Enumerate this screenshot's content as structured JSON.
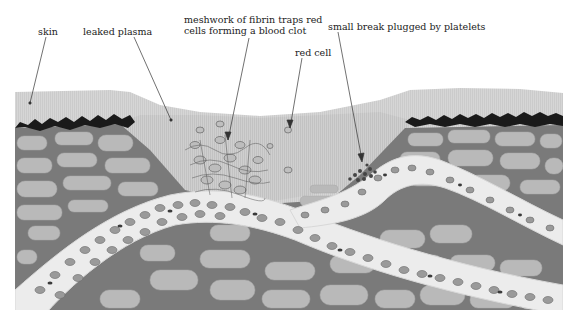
{
  "diagram": {
    "type": "anatomical-illustration",
    "colors": {
      "background": "#ffffff",
      "plasma": "#c9c9c9",
      "skin_surface": "#d2d2d2",
      "scab": "#1a1a1a",
      "tissue_matrix": "#7a7a7a",
      "tissue_cell": "#b8b8b8",
      "vessel": "#ececec",
      "red_cell": "#8a8a8a",
      "red_cell_dark": "#3a3a3a",
      "leader_line": "#333333"
    },
    "labels": [
      {
        "id": "skin",
        "text": "skin"
      },
      {
        "id": "leaked-plasma",
        "text": "leaked plasma"
      },
      {
        "id": "fibrin-line1",
        "text": "meshwork of fibrin traps red"
      },
      {
        "id": "fibrin-line2",
        "text": "cells forming a blood clot"
      },
      {
        "id": "red-cell",
        "text": "red cell"
      },
      {
        "id": "platelet-plug",
        "text": "small break plugged by platelets"
      }
    ]
  }
}
